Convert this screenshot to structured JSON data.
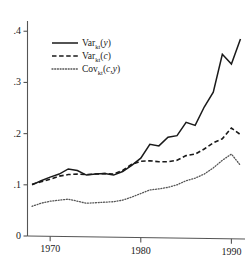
{
  "chart_data": {
    "type": "line",
    "title": "",
    "subtitle": "",
    "xlabel": "",
    "ylabel": "",
    "xlim": [
      1967.5,
      1991.5
    ],
    "ylim": [
      0,
      0.42
    ],
    "grid": false,
    "legend_position": "upper-left-inside",
    "x_ticks": [
      1970,
      1980,
      1990
    ],
    "x_tick_labels": [
      "1970",
      "1980",
      "1990"
    ],
    "y_ticks": [
      0,
      0.1,
      0.2,
      0.3,
      0.4
    ],
    "y_tick_labels": [
      "0",
      ".1",
      ".2",
      ".3",
      ".4"
    ],
    "x": [
      1968,
      1969,
      1970,
      1971,
      1972,
      1973,
      1974,
      1975,
      1976,
      1977,
      1978,
      1979,
      1980,
      1981,
      1982,
      1983,
      1984,
      1985,
      1986,
      1987,
      1988,
      1989,
      1990,
      1991
    ],
    "series": [
      {
        "name": "Var_kt(y)",
        "label_main": "Var",
        "label_sub": "kt",
        "label_arg": "(y)",
        "style": "solid",
        "color": "#1a1a1a",
        "values": [
          0.1,
          0.108,
          0.115,
          0.121,
          0.131,
          0.128,
          0.119,
          0.121,
          0.122,
          0.119,
          0.126,
          0.138,
          0.152,
          0.179,
          0.176,
          0.193,
          0.196,
          0.222,
          0.216,
          0.252,
          0.281,
          0.355,
          0.336,
          0.385
        ]
      },
      {
        "name": "Var_kt(c)",
        "label_main": "Var",
        "label_sub": "kt",
        "label_arg": "(c)",
        "style": "dashed",
        "color": "#1a1a1a",
        "values": [
          0.101,
          0.106,
          0.111,
          0.117,
          0.12,
          0.121,
          0.12,
          0.121,
          0.122,
          0.121,
          0.128,
          0.14,
          0.146,
          0.147,
          0.145,
          0.145,
          0.148,
          0.157,
          0.16,
          0.17,
          0.182,
          0.19,
          0.211,
          0.198
        ]
      },
      {
        "name": "Cov_kt(c,y)",
        "label_main": "Cov",
        "label_sub": "kt",
        "label_arg": "(c,y)",
        "style": "dotted",
        "color": "#555555",
        "values": [
          0.058,
          0.064,
          0.068,
          0.07,
          0.072,
          0.068,
          0.064,
          0.065,
          0.066,
          0.067,
          0.07,
          0.076,
          0.083,
          0.09,
          0.092,
          0.095,
          0.1,
          0.108,
          0.113,
          0.121,
          0.133,
          0.148,
          0.16,
          0.138
        ]
      }
    ],
    "legend": [
      {
        "key": "solid",
        "text_main": "Var",
        "text_sub": "kt",
        "text_arg": "(y)"
      },
      {
        "key": "dashed",
        "text_main": "Var",
        "text_sub": "kt",
        "text_arg": "(c)"
      },
      {
        "key": "dotted",
        "text_main": "Cov",
        "text_sub": "kt",
        "text_arg": "(c,y)"
      }
    ]
  }
}
